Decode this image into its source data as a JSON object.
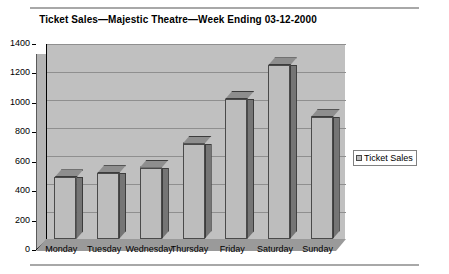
{
  "chart": {
    "title": "Ticket Sales—Majestic Theatre—Week Ending 03-12-2000",
    "legend_label": "Ticket Sales"
  },
  "chart_data": {
    "type": "bar",
    "title": "Ticket Sales—Majestic Theatre—Week Ending 03-12-2000",
    "xlabel": "",
    "ylabel": "",
    "categories": [
      "Monday",
      "Tuesday",
      "Wednesday",
      "Thursday",
      "Friday",
      "Saturday",
      "Sunday"
    ],
    "series": [
      {
        "name": "Ticket Sales",
        "values": [
          440,
          470,
          510,
          680,
          1000,
          1240,
          870
        ]
      }
    ],
    "ylim": [
      0,
      1400
    ],
    "yticks": [
      0,
      200,
      400,
      600,
      800,
      1000,
      1200,
      1400
    ],
    "ytick_labels": [
      "0",
      "200",
      "400",
      "600",
      "800",
      "1000",
      "1200",
      "1400"
    ],
    "grid": true,
    "legend_position": "right",
    "style": "3d-column",
    "colors": {
      "plot_background": "#c0c0c0",
      "bar_face": "#bdbdbd",
      "bar_side": "#757575",
      "bar_top": "#8e8e8e",
      "gridline": "#8f8f8f",
      "floor": "#9a9a9a",
      "side_wall": "#b4b4b4",
      "text": "#000000"
    }
  }
}
